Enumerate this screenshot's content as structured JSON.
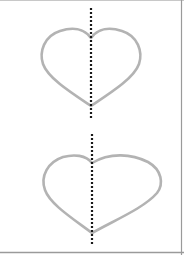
{
  "diagram": {
    "title": "",
    "colors": {
      "background": "#ffffff",
      "heart_stroke": "#b3b3b3",
      "dotted_line": "#1a1a1a",
      "border": "#9a9a9a"
    },
    "figures": [
      {
        "id": "top-heart",
        "shape": "heart",
        "symmetric": true,
        "axis_x": 91,
        "axis_y_range": [
          7,
          117
        ]
      },
      {
        "id": "bottom-heart",
        "shape": "heart",
        "symmetric": false,
        "axis_x": 92,
        "axis_y_range": [
          133,
          244
        ]
      }
    ]
  }
}
